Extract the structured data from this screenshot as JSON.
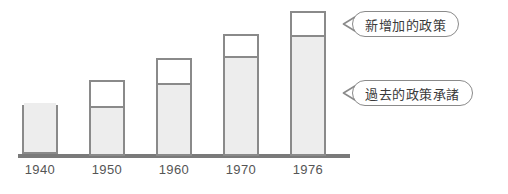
{
  "chart_data": {
    "type": "bar",
    "subtype": "stacked",
    "title": "",
    "xlabel": "",
    "ylabel": "",
    "grid": false,
    "axis": {
      "x_categories": [
        "1940",
        "1950",
        "1960",
        "1976_placeholder",
        "1976"
      ],
      "y_axis_visible": false,
      "x_axis_visible": true
    },
    "categories": [
      "1940",
      "1950",
      "1960",
      "1970",
      "1976"
    ],
    "series": [
      {
        "name": "過去的政策承諸",
        "fill": "#ededed",
        "values": [
          49,
          48,
          71,
          98,
          119
        ]
      },
      {
        "name": "新增加的政策",
        "fill": "#ffffff",
        "values": [
          0,
          28,
          27,
          24,
          26
        ]
      }
    ],
    "totals": [
      49,
      76,
      98,
      122,
      145
    ],
    "units": "relative bar height (px)",
    "legend_position": "callout-right",
    "annotations": [
      {
        "id": "callout-new-policy",
        "text": "新增加的政策",
        "points_to": "1976 upper white segment"
      },
      {
        "id": "callout-past-policy",
        "text": "過去的政策承諸",
        "points_to": "1976 lower gray segment"
      }
    ]
  },
  "colors": {
    "bar_fill_past": "#ededed",
    "bar_fill_new": "#ffffff",
    "bar_border": "#8a8a8a",
    "axis_line": "#7a7a7a",
    "tick_label": "#555555",
    "callout_text": "#3a3a3a",
    "callout_border": "#8a8a8a",
    "background": "#ffffff"
  },
  "ticks": [
    {
      "label": "1940"
    },
    {
      "label": "1950"
    },
    {
      "label": "1960"
    },
    {
      "label": "1970"
    },
    {
      "label": "1976"
    }
  ],
  "bars": [
    {
      "category": "1940",
      "left": 22,
      "top": 105,
      "height": 49,
      "past_height": 49,
      "new_height": 0,
      "has_divider": false
    },
    {
      "category": "1950",
      "left": 89,
      "top": 80,
      "height": 76,
      "past_height": 48,
      "new_height": 28,
      "has_divider": true
    },
    {
      "category": "1960",
      "left": 156,
      "top": 58,
      "height": 98,
      "past_height": 71,
      "new_height": 27,
      "has_divider": true
    },
    {
      "category": "1970",
      "left": 223,
      "top": 34,
      "height": 122,
      "past_height": 98,
      "new_height": 24,
      "has_divider": true
    },
    {
      "category": "1976",
      "left": 290,
      "top": 11,
      "height": 145,
      "past_height": 119,
      "new_height": 26,
      "has_divider": true
    }
  ],
  "callouts": [
    {
      "id": "new-policy",
      "text": "新增加的政策",
      "left": 342,
      "top": 11
    },
    {
      "id": "past-policy",
      "text": "過去的政策承諸",
      "left": 342,
      "top": 80
    }
  ]
}
